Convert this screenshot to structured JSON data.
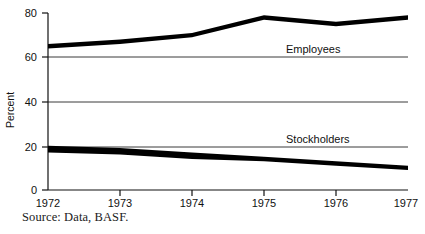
{
  "chart_data": {
    "type": "area",
    "title": "",
    "subtitle": "",
    "xlabel": "",
    "ylabel": "Percent",
    "x": [
      1972,
      1973,
      1974,
      1975,
      1976,
      1977
    ],
    "xtick_labels": [
      "1972",
      "1973",
      "1974",
      "1975",
      "1976",
      "1977"
    ],
    "ytick_labels": [
      "0",
      "20",
      "40",
      "60",
      "80"
    ],
    "yticks": [
      0,
      20,
      40,
      60,
      80
    ],
    "ylim": [
      0,
      80
    ],
    "xlim": [
      1972,
      1977
    ],
    "grid": "horizontal",
    "legend_position": "inline-right",
    "band_style": "filled-black-band-between-upper-and-lower-bounds",
    "series": [
      {
        "name": "Employees",
        "label": "Employees",
        "color": "#000000",
        "upper": [
          66,
          68,
          71,
          79,
          76,
          79
        ],
        "lower": [
          64,
          66,
          69,
          77,
          74,
          77
        ],
        "values": [
          65,
          67,
          70,
          78,
          75,
          78
        ]
      },
      {
        "name": "Stockholders",
        "label": "Stockholders",
        "color": "#000000",
        "upper": [
          20,
          19,
          17,
          15,
          13,
          11
        ],
        "lower": [
          17,
          16,
          14,
          13,
          11,
          9
        ],
        "values": [
          18.5,
          17.5,
          15.5,
          14,
          12,
          10
        ]
      }
    ],
    "annotations": [
      {
        "text": "Employees",
        "x": 1975.1,
        "y": 62
      },
      {
        "text": "Stockholders",
        "x": 1975.1,
        "y": 22
      }
    ],
    "source": "Source: Data, BASF."
  },
  "figure": {
    "source_note": "Source: Data, BASF.",
    "y_axis_title": "Percent"
  }
}
